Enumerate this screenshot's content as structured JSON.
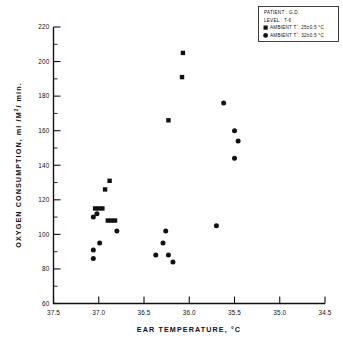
{
  "chart_data": {
    "type": "scatter",
    "title": "",
    "xlabel": "EAR  TEMPERATURE, °C",
    "ylabel": "OXYGEN  CONSUMPTION, ml /M²/ min.",
    "xlim": [
      37.5,
      34.5
    ],
    "ylim": [
      60,
      220
    ],
    "x_reversed": true,
    "xticks": [
      37.5,
      37.0,
      36.5,
      36.0,
      35.5,
      35.0,
      34.5
    ],
    "xtick_labels": [
      "37.5",
      "37.0",
      "36.5",
      "36.0",
      "35.5",
      "35.0",
      "34.5"
    ],
    "yticks": [
      60,
      80,
      100,
      120,
      140,
      160,
      180,
      200,
      220
    ],
    "ytick_labels": [
      "60",
      "80",
      "100",
      "120",
      "140",
      "160",
      "180",
      "200",
      "220"
    ],
    "y_minor_step": 10,
    "grid": false,
    "legend_position": "top-right",
    "series": [
      {
        "name": "AMBIENT T°: 25±0.5 °C",
        "marker": "square",
        "color": "#111111",
        "points": [
          {
            "x": 37.04,
            "y": 115
          },
          {
            "x": 37.0,
            "y": 115
          },
          {
            "x": 36.96,
            "y": 115
          },
          {
            "x": 36.9,
            "y": 108
          },
          {
            "x": 36.86,
            "y": 108
          },
          {
            "x": 36.82,
            "y": 108
          },
          {
            "x": 36.93,
            "y": 126
          },
          {
            "x": 36.88,
            "y": 131
          },
          {
            "x": 36.23,
            "y": 166
          },
          {
            "x": 36.08,
            "y": 191
          },
          {
            "x": 36.07,
            "y": 205
          }
        ]
      },
      {
        "name": "AMBIENT T°: 32±0.5 °C",
        "marker": "circle",
        "color": "#111111",
        "points": [
          {
            "x": 37.06,
            "y": 110
          },
          {
            "x": 37.02,
            "y": 112
          },
          {
            "x": 36.99,
            "y": 95
          },
          {
            "x": 37.06,
            "y": 91
          },
          {
            "x": 37.06,
            "y": 86
          },
          {
            "x": 36.8,
            "y": 102
          },
          {
            "x": 36.37,
            "y": 88
          },
          {
            "x": 36.29,
            "y": 95
          },
          {
            "x": 36.26,
            "y": 102
          },
          {
            "x": 36.23,
            "y": 88
          },
          {
            "x": 36.18,
            "y": 84
          },
          {
            "x": 35.7,
            "y": 105
          },
          {
            "x": 35.62,
            "y": 176
          },
          {
            "x": 35.5,
            "y": 160
          },
          {
            "x": 35.46,
            "y": 154
          },
          {
            "x": 35.5,
            "y": 144
          }
        ]
      }
    ],
    "annotations": {
      "patient_label": "PATIENT :",
      "patient_value": "G.D.",
      "level_label": "LEVEL :",
      "level_value": "T-6"
    }
  },
  "legend": {
    "line1": "PATIENT : G.D.",
    "line2": "LEVEL : T-6",
    "entry_square_prefix": "AMBIENT T",
    "entry_square_value": ": 25±0.5 °C",
    "entry_circle_prefix": "AMBIENT T",
    "entry_circle_value": ": 32±0.5 °C",
    "degree_sup": "°"
  },
  "axes": {
    "x_title": "EAR  TEMPERATURE, °C",
    "y_title_main": "OXYGEN  CONSUMPTION, ml /M",
    "y_title_sup": "2",
    "y_title_tail": "/ min."
  }
}
